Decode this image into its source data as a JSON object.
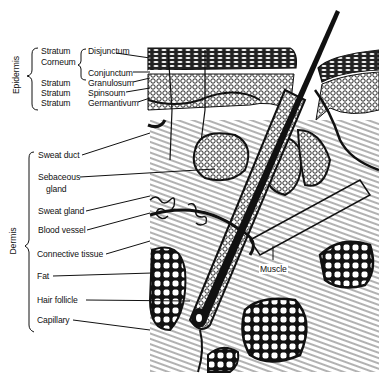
{
  "diagram": {
    "groups": [
      {
        "name": "Epidermis",
        "strata": [
          {
            "prefix": "Stratum",
            "prefix2": "Corneum",
            "sublayers": [
              "Disjunctum",
              "Conjunctum"
            ]
          },
          {
            "prefix": "Stratum",
            "label": "Granulosum"
          },
          {
            "prefix": "Stratum",
            "label": "Spinsoum"
          },
          {
            "prefix": "Stratum",
            "label": "Germantivum"
          }
        ]
      },
      {
        "name": "Dermis",
        "labels": [
          "Sweat duct",
          "Sebaceous",
          "gland",
          "Sweat gland",
          "Blood vessel",
          "Connective tissue",
          "Fat",
          "Hair follicle",
          "Capillary"
        ]
      }
    ],
    "inline_labels": {
      "muscle": "Muscle"
    }
  }
}
